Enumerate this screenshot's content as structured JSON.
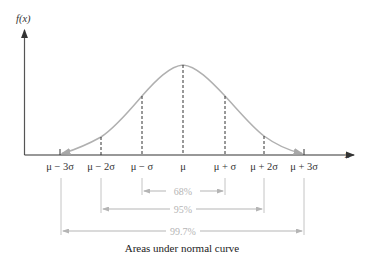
{
  "axes": {
    "y_label": "f(x)",
    "x_label": "x"
  },
  "ticks": [
    {
      "label": "μ − 3σ",
      "x": 60
    },
    {
      "label": "μ − 2σ",
      "x": 101
    },
    {
      "label": "μ − σ",
      "x": 142
    },
    {
      "label": "μ",
      "x": 183
    },
    {
      "label": "μ + σ",
      "x": 225
    },
    {
      "label": "μ + 2σ",
      "x": 264
    },
    {
      "label": "μ + 3σ",
      "x": 304
    }
  ],
  "intervals": [
    {
      "label": "68%",
      "range": "μ ± σ"
    },
    {
      "label": "95%",
      "range": "μ ± 2σ"
    },
    {
      "label": "99.7%",
      "range": "μ ± 3σ"
    }
  ],
  "caption": "Areas under normal curve",
  "colors": {
    "axis": "#333333",
    "curve": "#b0b0b0",
    "dashed": "#333333",
    "interval": "#b5b5b5"
  }
}
